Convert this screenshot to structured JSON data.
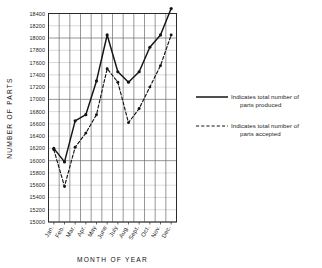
{
  "chart_data": {
    "type": "line",
    "title": "",
    "xlabel": "MONTH OF YEAR",
    "ylabel": "NUMBER OF PARTS",
    "categories": [
      "Jan.",
      "Feb.",
      "Mar.",
      "Apr.",
      "May",
      "June",
      "July",
      "Aug.",
      "Sept.",
      "Oct.",
      "Nov.",
      "Dec."
    ],
    "ylim": [
      15000,
      18400
    ],
    "ytick_step": 200,
    "yticks": [
      15000,
      15200,
      15400,
      15600,
      15800,
      16000,
      16200,
      16400,
      16600,
      16800,
      17000,
      17200,
      17400,
      17600,
      17800,
      18000,
      18200,
      18400
    ],
    "ytick_labels": [
      "15000",
      "15200",
      "15400",
      "15600",
      "15800",
      "16000",
      "16200",
      "16400",
      "16600",
      "16800",
      "17000",
      "17200",
      "17400",
      "17600",
      "17800",
      "18000",
      "18200",
      "18400"
    ],
    "grid": true,
    "legend_position": "right",
    "series": [
      {
        "name": "parts produced",
        "style": "solid",
        "values": [
          16200,
          15980,
          16650,
          16750,
          17300,
          18050,
          17450,
          17280,
          17450,
          17850,
          18050,
          18480
        ]
      },
      {
        "name": "parts accepted",
        "style": "dashed",
        "values": [
          16180,
          15580,
          16220,
          16450,
          16750,
          17500,
          17280,
          16620,
          16850,
          17200,
          17550,
          18050
        ]
      }
    ]
  },
  "legend": {
    "items": [
      {
        "line1": "Indicates total number of",
        "line2": "parts produced",
        "style": "solid"
      },
      {
        "line1": "Indicates total number of",
        "line2": "parts accepted",
        "style": "dashed"
      }
    ]
  }
}
